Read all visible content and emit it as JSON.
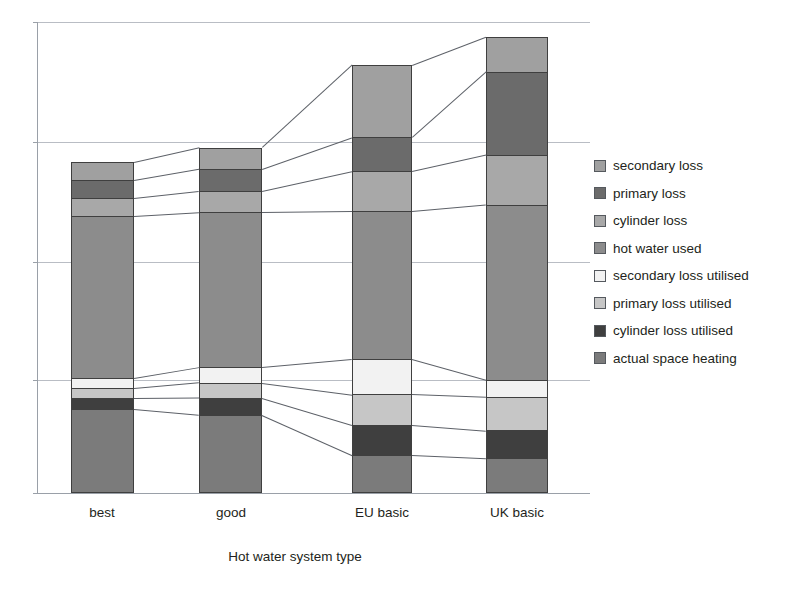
{
  "chart_data": {
    "type": "bar",
    "subtype": "stacked-bar",
    "title": "",
    "xlabel": "Hot water system type",
    "ylabel": "",
    "categories": [
      "best",
      "good",
      "EU basic",
      "UK basic"
    ],
    "grid": true,
    "grid_count": 4,
    "y_tick_labels": [],
    "ylim": [
      0,
      100
    ],
    "legend_position": "right",
    "stack_order_top_to_bottom": [
      "secondary loss",
      "primary loss",
      "cylinder loss",
      "hot water used",
      "secondary loss utilised",
      "primary loss utilised",
      "cylinder loss utilised",
      "actual space heating"
    ],
    "series": [
      {
        "name": "actual space heating",
        "color": "#7b7b7b",
        "values": [
          17.8,
          16.6,
          8.1,
          7.4
        ]
      },
      {
        "name": "cylinder loss utilised",
        "color": "#3f3f3f",
        "values": [
          2.3,
          3.6,
          6.4,
          5.9
        ]
      },
      {
        "name": "primary loss utilised",
        "color": "#c6c6c6",
        "values": [
          2.1,
          3.2,
          6.4,
          7.0
        ]
      },
      {
        "name": "secondary loss utilised",
        "color": "#f2f2f2",
        "values": [
          2.1,
          3.2,
          7.4,
          3.6
        ]
      },
      {
        "name": "hot water used",
        "color": "#8c8c8c",
        "values": [
          34.4,
          32.9,
          31.4,
          37.2
        ]
      },
      {
        "name": "cylinder loss",
        "color": "#a8a8a8",
        "values": [
          3.8,
          4.5,
          8.5,
          10.6
        ]
      },
      {
        "name": "primary loss",
        "color": "#6b6b6b",
        "values": [
          3.8,
          4.7,
          7.2,
          17.6
        ]
      },
      {
        "name": "secondary loss",
        "color": "#a0a0a0",
        "values": [
          3.8,
          4.5,
          15.3,
          7.4
        ]
      }
    ],
    "totals": [
      70.3,
      73.0,
      90.7,
      96.8
    ]
  },
  "axis": {
    "x_title": "Hot water system type",
    "categories": [
      "best",
      "good",
      "EU basic",
      "UK basic"
    ]
  },
  "legend": {
    "items": [
      {
        "label": "secondary loss",
        "color": "#a0a0a0"
      },
      {
        "label": "primary loss",
        "color": "#6b6b6b"
      },
      {
        "label": "cylinder loss",
        "color": "#a8a8a8"
      },
      {
        "label": "hot water used",
        "color": "#8c8c8c"
      },
      {
        "label": "secondary loss utilised",
        "color": "#f2f2f2"
      },
      {
        "label": "primary loss utilised",
        "color": "#c6c6c6"
      },
      {
        "label": "cylinder loss utilised",
        "color": "#3f3f3f"
      },
      {
        "label": "actual space heating",
        "color": "#7b7b7b"
      }
    ]
  }
}
